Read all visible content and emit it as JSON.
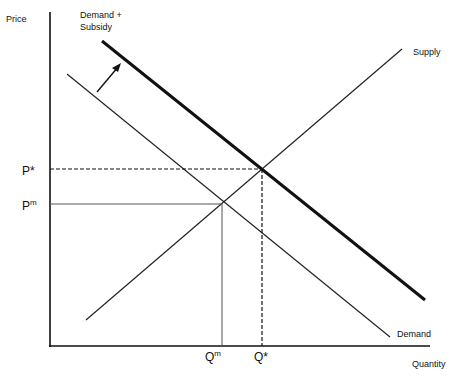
{
  "diagram": {
    "type": "supply-demand-subsidy",
    "axes": {
      "y_label": "Price",
      "x_label": "Quantity"
    },
    "curves": {
      "supply": {
        "label": "Supply"
      },
      "demand": {
        "label": "Demand"
      },
      "demand_subsidy": {
        "label_line1": "Demand +",
        "label_line2": "Subsidy"
      }
    },
    "price_ticks": {
      "p_star": "P*",
      "p_m_base": "P",
      "p_m_sup": "m"
    },
    "quantity_ticks": {
      "q_m_base": "Q",
      "q_m_sup": "m",
      "q_star": "Q*"
    },
    "colors": {
      "line": "#111111",
      "background": "#ffffff"
    }
  }
}
